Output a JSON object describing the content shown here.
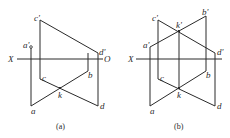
{
  "diagrams": [
    {
      "id": "a",
      "caption": "(a)",
      "axis": {
        "left_label": "X",
        "right_label": "O"
      },
      "labels": {
        "c_prime": "c'",
        "a_prime": "a'",
        "d_prime": "d'",
        "c": "c",
        "b": "b",
        "k": "k",
        "a": "a",
        "d": "d"
      }
    },
    {
      "id": "b",
      "caption": "(b)",
      "axis": {
        "left_label": "X"
      },
      "labels": {
        "c_prime": "c'",
        "k_prime": "k'",
        "b_prime": "b'",
        "a_prime": "a'",
        "d_prime": "d'",
        "c": "c",
        "b": "b",
        "k": "k",
        "a": "a",
        "d": "d"
      }
    }
  ],
  "colors": {
    "line": "#2a2a2a",
    "background": "#ffffff"
  }
}
